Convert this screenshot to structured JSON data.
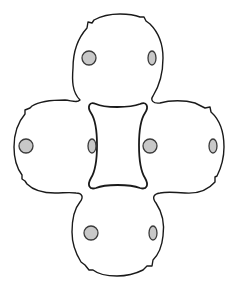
{
  "figure": {
    "type": "line-drawing",
    "colors": {
      "background": "#ffffff",
      "outline": "#1a1a1a",
      "dot_fill": "#c8c8c8",
      "dot_stroke": "#3a3a3a"
    },
    "lobes": [
      {
        "name": "top",
        "cx": 117,
        "cy": 55
      },
      {
        "name": "left",
        "cx": 50,
        "cy": 145
      },
      {
        "name": "right",
        "cx": 183,
        "cy": 145
      },
      {
        "name": "bottom",
        "cx": 117,
        "cy": 232
      }
    ],
    "dots": [
      {
        "lobe": "top",
        "shape": "circle",
        "cx": 89,
        "cy": 58,
        "rx": 7,
        "ry": 7
      },
      {
        "lobe": "top",
        "shape": "ellipse",
        "cx": 152,
        "cy": 58,
        "rx": 4,
        "ry": 7
      },
      {
        "lobe": "left",
        "shape": "circle",
        "cx": 26,
        "cy": 146,
        "rx": 7,
        "ry": 7
      },
      {
        "lobe": "left",
        "shape": "ellipse",
        "cx": 92,
        "cy": 146,
        "rx": 4,
        "ry": 7
      },
      {
        "lobe": "right",
        "shape": "circle",
        "cx": 150,
        "cy": 146,
        "rx": 7,
        "ry": 7
      },
      {
        "lobe": "right",
        "shape": "ellipse",
        "cx": 213,
        "cy": 146,
        "rx": 4,
        "ry": 7
      },
      {
        "lobe": "bottom",
        "shape": "circle",
        "cx": 91,
        "cy": 233,
        "rx": 7,
        "ry": 7
      },
      {
        "lobe": "bottom",
        "shape": "ellipse",
        "cx": 153,
        "cy": 233,
        "rx": 4,
        "ry": 7
      }
    ]
  }
}
